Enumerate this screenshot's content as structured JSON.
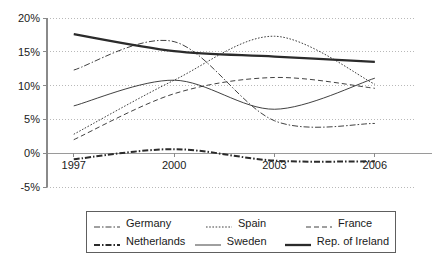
{
  "chart_data": {
    "type": "line",
    "title": "",
    "subtitle": "",
    "xlabel": "",
    "ylabel": "",
    "x": [
      1997,
      2000,
      2003,
      2006
    ],
    "xtick_labels": [
      "1997",
      "2000",
      "2003",
      "2006"
    ],
    "ytick_labels": [
      "20%",
      "15%",
      "10%",
      "5%",
      "0%",
      "-5%"
    ],
    "ytick_values": [
      20,
      15,
      10,
      5,
      0,
      -5
    ],
    "ylim": [
      -5,
      20
    ],
    "xlim": [
      1996.2,
      2007.2
    ],
    "grid": "horizontal-dotted",
    "legend_position": "bottom",
    "value_unit": "percent",
    "series": [
      {
        "name": "Germany",
        "style": "dash-dot-thin",
        "color": "#2b2b2b",
        "values": [
          12.3,
          16.5,
          4.8,
          4.4
        ]
      },
      {
        "name": "Spain",
        "style": "dotted",
        "color": "#2b2b2b",
        "values": [
          2.8,
          10.8,
          17.3,
          10.2
        ]
      },
      {
        "name": "France",
        "style": "dashed",
        "color": "#2b2b2b",
        "values": [
          2.0,
          8.8,
          11.2,
          9.6
        ]
      },
      {
        "name": "Netherlands",
        "style": "dash-dot-thick",
        "color": "#2b2b2b",
        "values": [
          -0.9,
          0.6,
          -1.1,
          -1.2
        ]
      },
      {
        "name": "Sweden",
        "style": "solid-thin",
        "color": "#2b2b2b",
        "values": [
          7.0,
          10.8,
          6.5,
          11.1
        ]
      },
      {
        "name": "Rep. of  Ireland",
        "style": "solid-thick",
        "color": "#2b2b2b",
        "values": [
          17.6,
          15.1,
          14.3,
          13.5
        ]
      }
    ]
  },
  "legend": {
    "rows": [
      [
        {
          "label": "Germany",
          "style": "dash-dot-thin"
        },
        {
          "label": "Spain",
          "style": "dotted"
        },
        {
          "label": "France",
          "style": "dashed"
        }
      ],
      [
        {
          "label": "Netherlands",
          "style": "dash-dot-thick"
        },
        {
          "label": "Sweden",
          "style": "solid-thin"
        },
        {
          "label": "Rep. of  Ireland",
          "style": "solid-thick"
        }
      ]
    ]
  }
}
